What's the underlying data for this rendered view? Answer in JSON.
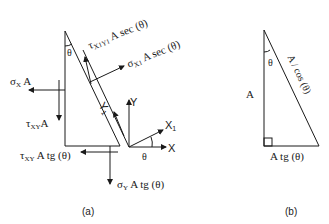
{
  "figure_a": {
    "caption": "(a)",
    "theta_top": "θ",
    "theta_axis": "θ",
    "tau_x1y1": {
      "sym": "τ",
      "sub": "X1Y1",
      "rest": " A sec (θ)"
    },
    "sigma_x1": {
      "sym": "σ",
      "sub": "X1",
      "rest": " A sec (θ)"
    },
    "sigma_x": {
      "sym": "σ",
      "sub": "X",
      "rest": " A"
    },
    "tau_xy": {
      "sym": "τ",
      "sub": "XY",
      "rest": "A"
    },
    "tau_xy_tg": {
      "sym": "τ",
      "sub": "XY",
      "rest": " A tg (θ)"
    },
    "sigma_y_tg": {
      "sym": "σ",
      "sub": "Y",
      "rest": " A tg (θ)"
    },
    "axis_x": "X",
    "axis_y": "Y",
    "axis_x1": "X",
    "axis_x1_sub": "1",
    "axis_y1": "Y",
    "axis_y1_sub": "1"
  },
  "figure_b": {
    "caption": "(b)",
    "theta": "θ",
    "side_vertical": "A",
    "side_hypotenuse": "A / cos (θ)",
    "side_bottom": "A tg (θ)"
  }
}
